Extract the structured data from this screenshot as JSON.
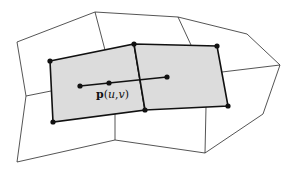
{
  "diagram": {
    "type": "quad-mesh-patch",
    "colors": {
      "shade": "#dcdcdc",
      "stroke": "#111111",
      "thin_stroke": "#2a2a2a",
      "background": "#ffffff"
    },
    "label": {
      "bold_part": "p",
      "open": "(",
      "u": "u",
      "comma": ",",
      "v": "v",
      "close": ")"
    },
    "shaded_quads": [
      {
        "id": "left-face",
        "points": [
          [
            50,
            61
          ],
          [
            134,
            44
          ],
          [
            145,
            110
          ],
          [
            53,
            122
          ]
        ]
      },
      {
        "id": "right-face",
        "points": [
          [
            134,
            44
          ],
          [
            217,
            46
          ],
          [
            228,
            106
          ],
          [
            145,
            110
          ]
        ]
      }
    ],
    "vertices": [
      [
        50,
        61
      ],
      [
        134,
        44
      ],
      [
        217,
        46
      ],
      [
        53,
        122
      ],
      [
        145,
        110
      ],
      [
        228,
        106
      ]
    ],
    "parameter_line": {
      "points": [
        [
          80,
          86
        ],
        [
          109,
          83
        ],
        [
          167,
          77
        ]
      ]
    }
  }
}
